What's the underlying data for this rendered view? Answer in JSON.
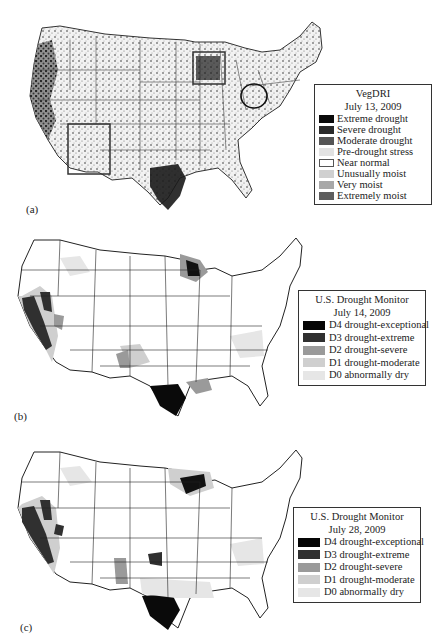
{
  "panels": [
    {
      "id": "a",
      "label": "(a)",
      "legend": {
        "title": "VegDRI",
        "date": "July 13, 2009",
        "items": [
          {
            "label": "Extreme drought",
            "color": "#0a0a0a"
          },
          {
            "label": "Severe drought",
            "color": "#2a2a2a"
          },
          {
            "label": "Moderate drought",
            "color": "#555555"
          },
          {
            "label": "Pre-drought stress",
            "color": "#e2e2e2"
          },
          {
            "label": "Near normal",
            "color": "#ffffff"
          },
          {
            "label": "Unusually moist",
            "color": "#d0d0d0"
          },
          {
            "label": "Very moist",
            "color": "#a8a8a8"
          },
          {
            "label": "Extremely moist",
            "color": "#5e5e5e"
          }
        ]
      },
      "annotations": [
        "rectangle-southwest-arizona",
        "rectangle-minnesota-wisconsin",
        "circle-ohio"
      ]
    },
    {
      "id": "b",
      "label": "(b)",
      "legend": {
        "title": "U.S. Drought Monitor",
        "date": "July 14, 2009",
        "items": [
          {
            "label": "D4 drought-exceptional",
            "color": "#050505"
          },
          {
            "label": "D3 drought-extreme",
            "color": "#303030"
          },
          {
            "label": "D2 drought-severe",
            "color": "#9a9a9a"
          },
          {
            "label": "D1 drought-moderate",
            "color": "#cfcfcf"
          },
          {
            "label": "D0 abnormally dry",
            "color": "#e6e6e6"
          }
        ]
      }
    },
    {
      "id": "c",
      "label": "(c)",
      "legend": {
        "title": "U.S. Drought Monitor",
        "date": "July 28, 2009",
        "items": [
          {
            "label": "D4 drought-exceptional",
            "color": "#050505"
          },
          {
            "label": "D3 drought-extreme",
            "color": "#303030"
          },
          {
            "label": "D2 drought-severe",
            "color": "#9a9a9a"
          },
          {
            "label": "D1 drought-moderate",
            "color": "#cfcfcf"
          },
          {
            "label": "D0 abnormally dry",
            "color": "#e6e6e6"
          }
        ]
      }
    }
  ]
}
